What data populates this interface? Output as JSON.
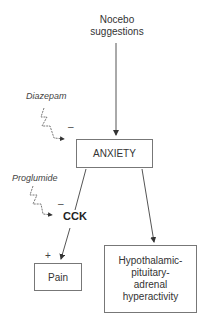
{
  "diagram": {
    "source_node": {
      "line1": "Nocebo",
      "line2": "suggestions"
    },
    "center_node": "ANXIETY",
    "mediator_node": "CCK",
    "outcome_pain": "Pain",
    "outcome_hpa": {
      "line1": "Hypothalamic-",
      "line2": "pituitary-",
      "line3": "adrenal",
      "line4": "hyperactivity"
    },
    "inhibitors": [
      {
        "drug": "Diazepam",
        "target": "ANXIETY",
        "sign": "–"
      },
      {
        "drug": "Proglumide",
        "target": "CCK",
        "sign": "–"
      }
    ],
    "effect_sign_pain": "+",
    "edges": [
      {
        "from": "Nocebo suggestions",
        "to": "ANXIETY"
      },
      {
        "from": "ANXIETY",
        "to": "CCK"
      },
      {
        "from": "CCK",
        "to": "Pain",
        "sign": "+"
      },
      {
        "from": "ANXIETY",
        "to": "Hypothalamic-pituitary-adrenal hyperactivity"
      },
      {
        "from": "Diazepam",
        "to": "ANXIETY",
        "sign": "–",
        "style": "zigzag"
      },
      {
        "from": "Proglumide",
        "to": "CCK",
        "sign": "–",
        "style": "zigzag"
      }
    ]
  }
}
